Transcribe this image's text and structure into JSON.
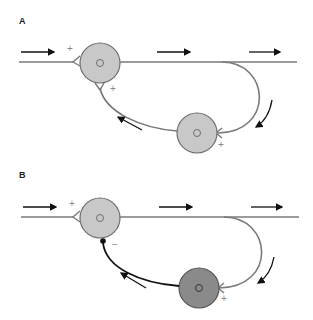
{
  "panels": [
    {
      "label": "A",
      "input_sign": "+",
      "feedback_sign": "+",
      "output_sign": "+",
      "interneuron_color": "#c8c8c8",
      "feedback_line_color": "#777777",
      "feedback_terminal": "excitatory-fork"
    },
    {
      "label": "B",
      "input_sign": "+",
      "feedback_sign": "−",
      "output_sign": "+",
      "interneuron_color": "#8a8a8a",
      "feedback_line_color": "#111111",
      "feedback_terminal": "inhibitory-dot"
    }
  ],
  "colors": {
    "axon": "#7a7a7a",
    "cell_fill_light": "#c8c8c8",
    "cell_fill_dark": "#8a8a8a",
    "cell_stroke": "#6e6e6e",
    "arrow": "#111111"
  }
}
